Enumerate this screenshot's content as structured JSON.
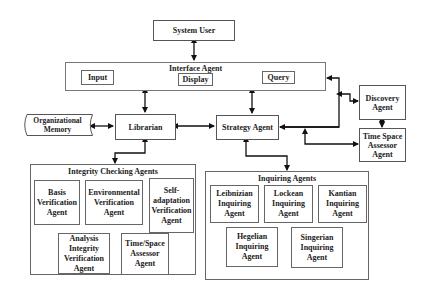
{
  "diagram": {
    "system_user": "System User",
    "interface_agent": {
      "title": "Interface Agent",
      "input": "Input",
      "display": "Display",
      "query": "Query"
    },
    "organizational_memory": "Organizational Memory",
    "librarian": "Librarian",
    "strategy_agent": "Strategy Agent",
    "discovery_agent": "Discovery Agent",
    "time_space_assessor": "Time Space Assessor Agent",
    "integrity_checking": {
      "title": "Integrity Checking Agents",
      "agents": [
        "Basis Verification Agent",
        "Environmental Verification Agent",
        "Self-adaptation Verification Agent",
        "Analysis Integrity Verification Agent",
        "Time/Space Assessor Agent"
      ]
    },
    "inquiring": {
      "title": "Inquiring Agents",
      "agents": [
        "Leibnizian Inquiring Agent",
        "Lockean Inquiring Agent",
        "Kantian Inquiring Agent",
        "Hegelian Inquiring Agent",
        "Singerian Inquiring Agent"
      ]
    }
  }
}
